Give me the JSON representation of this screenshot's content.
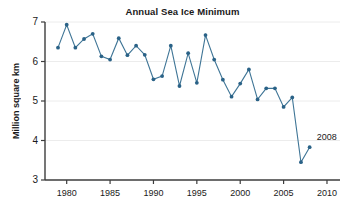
{
  "chart_data": {
    "type": "line",
    "title": "Annual Sea Ice Minimum",
    "xlabel": "",
    "ylabel": "Million square km",
    "xlim": [
      1977.5,
      2011.5
    ],
    "ylim": [
      3,
      7
    ],
    "xticks": [
      1980,
      1985,
      1990,
      1995,
      2000,
      2005,
      2010
    ],
    "xtick_labels": [
      "1980",
      "1985",
      "1990",
      "1995",
      "2000",
      "2005",
      "2010"
    ],
    "yticks": [
      3,
      4,
      5,
      6,
      7
    ],
    "ytick_labels": [
      "3",
      "4",
      "5",
      "6",
      "7"
    ],
    "grid": true,
    "grid_axis": "y",
    "legend": false,
    "line_color": "#3f7596",
    "marker_color": "#2a6287",
    "x": [
      1979,
      1980,
      1981,
      1982,
      1983,
      1984,
      1985,
      1986,
      1987,
      1988,
      1989,
      1990,
      1991,
      1992,
      1993,
      1994,
      1995,
      1996,
      1997,
      1998,
      1999,
      2000,
      2001,
      2002,
      2003,
      2004,
      2005,
      2006,
      2007,
      2008
    ],
    "values": [
      6.35,
      6.93,
      6.35,
      6.57,
      6.7,
      6.13,
      6.05,
      6.59,
      6.16,
      6.4,
      6.17,
      5.55,
      5.63,
      6.4,
      5.38,
      6.21,
      5.46,
      6.67,
      6.05,
      5.54,
      5.11,
      5.44,
      5.8,
      5.04,
      5.32,
      5.32,
      4.85,
      5.09,
      3.45,
      3.83
    ],
    "annotations": [
      {
        "text": "2008",
        "x": 2008,
        "y": 3.83,
        "dx": 7,
        "dy": -7
      }
    ]
  }
}
